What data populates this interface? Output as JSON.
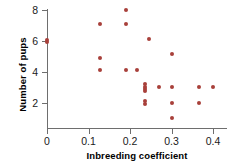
{
  "chart_data": {
    "type": "scatter",
    "title": "",
    "xlabel": "Inbreeding coefficient",
    "ylabel": "Number of pups",
    "xlim": [
      -0.015,
      0.435
    ],
    "ylim": [
      0.35,
      8.45
    ],
    "xticks": [
      0,
      0.1,
      0.2,
      0.3,
      0.4
    ],
    "xtick_labels": [
      "0",
      "0.1",
      "0.2",
      "0.3",
      "0.4"
    ],
    "yticks": [
      2,
      4,
      6,
      8
    ],
    "ytick_labels": [
      "2",
      "4",
      "6",
      "8"
    ],
    "grid": false,
    "legend": null,
    "marker_color": "#a8403a",
    "axis_color": "#6e6e6e",
    "points": [
      {
        "x": 0.0,
        "y": 6.08
      },
      {
        "x": 0.0,
        "y": 5.92
      },
      {
        "x": 0.128,
        "y": 7.12
      },
      {
        "x": 0.128,
        "y": 4.92
      },
      {
        "x": 0.128,
        "y": 4.15
      },
      {
        "x": 0.19,
        "y": 8.0
      },
      {
        "x": 0.19,
        "y": 7.08
      },
      {
        "x": 0.19,
        "y": 4.15
      },
      {
        "x": 0.218,
        "y": 4.15
      },
      {
        "x": 0.236,
        "y": 3.22
      },
      {
        "x": 0.236,
        "y": 3.05
      },
      {
        "x": 0.236,
        "y": 2.9
      },
      {
        "x": 0.236,
        "y": 2.75
      },
      {
        "x": 0.236,
        "y": 2.1
      },
      {
        "x": 0.236,
        "y": 1.95
      },
      {
        "x": 0.246,
        "y": 6.12
      },
      {
        "x": 0.27,
        "y": 3.02
      },
      {
        "x": 0.3,
        "y": 5.15
      },
      {
        "x": 0.3,
        "y": 3.02
      },
      {
        "x": 0.3,
        "y": 2.02
      },
      {
        "x": 0.3,
        "y": 1.02
      },
      {
        "x": 0.366,
        "y": 3.02
      },
      {
        "x": 0.366,
        "y": 2.02
      },
      {
        "x": 0.4,
        "y": 3.02
      }
    ]
  },
  "axes": {
    "x_title": "Inbreeding coefficient",
    "y_title": "Number of pups"
  }
}
